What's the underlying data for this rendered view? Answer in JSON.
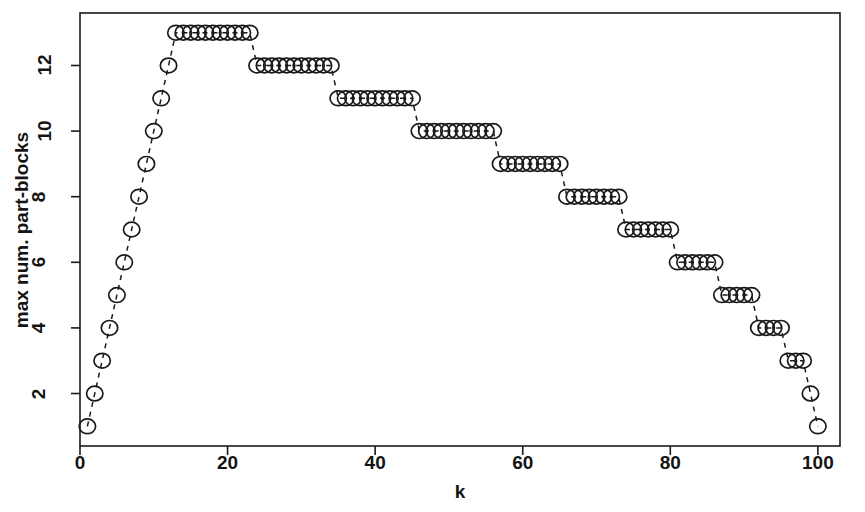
{
  "chart_data": {
    "type": "scatter",
    "title": "",
    "xlabel": "k",
    "ylabel": "max num. part-blocks",
    "xlim": [
      0,
      103
    ],
    "ylim": [
      0.4,
      13.6
    ],
    "xticks": [
      0,
      20,
      40,
      60,
      80,
      100
    ],
    "xtick_labels": [
      "0",
      "20",
      "40",
      "60",
      "80",
      "100"
    ],
    "yticks": [
      2,
      4,
      6,
      8,
      10,
      12
    ],
    "ytick_labels": [
      "2",
      "4",
      "6",
      "8",
      "10",
      "12"
    ],
    "grid": false,
    "legend": null,
    "marker": "open-circle",
    "line_style": "dashed",
    "series_name": "max num. part-blocks",
    "x": [
      1,
      2,
      3,
      4,
      5,
      6,
      7,
      8,
      9,
      10,
      11,
      12,
      13,
      14,
      15,
      16,
      17,
      18,
      19,
      20,
      21,
      22,
      23,
      24,
      25,
      26,
      27,
      28,
      29,
      30,
      31,
      32,
      33,
      34,
      35,
      36,
      37,
      38,
      39,
      40,
      41,
      42,
      43,
      44,
      45,
      46,
      47,
      48,
      49,
      50,
      51,
      52,
      53,
      54,
      55,
      56,
      57,
      58,
      59,
      60,
      61,
      62,
      63,
      64,
      65,
      66,
      67,
      68,
      69,
      70,
      71,
      72,
      73,
      74,
      75,
      76,
      77,
      78,
      79,
      80,
      81,
      82,
      83,
      84,
      85,
      86,
      87,
      88,
      89,
      90,
      91,
      92,
      93,
      94,
      95,
      96,
      97,
      98,
      99,
      100
    ],
    "y": [
      1,
      2,
      3,
      4,
      5,
      6,
      7,
      8,
      9,
      10,
      11,
      12,
      13,
      13,
      13,
      13,
      13,
      13,
      13,
      13,
      13,
      13,
      13,
      12,
      12,
      12,
      12,
      12,
      12,
      12,
      12,
      12,
      12,
      12,
      11,
      11,
      11,
      11,
      11,
      11,
      11,
      11,
      11,
      11,
      11,
      10,
      10,
      10,
      10,
      10,
      10,
      10,
      10,
      10,
      10,
      10,
      9,
      9,
      9,
      9,
      9,
      9,
      9,
      9,
      9,
      8,
      8,
      8,
      8,
      8,
      8,
      8,
      8,
      7,
      7,
      7,
      7,
      7,
      7,
      7,
      6,
      6,
      6,
      6,
      6,
      6,
      5,
      5,
      5,
      5,
      5,
      4,
      4,
      4,
      4,
      3,
      3,
      3,
      2,
      1
    ],
    "plateaus": [
      {
        "value": 13,
        "k_start": 13,
        "k_end": 23
      },
      {
        "value": 12,
        "k_start": 24,
        "k_end": 34
      },
      {
        "value": 11,
        "k_start": 35,
        "k_end": 45
      },
      {
        "value": 10,
        "k_start": 46,
        "k_end": 56
      },
      {
        "value": 9,
        "k_start": 57,
        "k_end": 65
      },
      {
        "value": 8,
        "k_start": 66,
        "k_end": 73
      },
      {
        "value": 7,
        "k_start": 74,
        "k_end": 80
      },
      {
        "value": 6,
        "k_start": 81,
        "k_end": 86
      },
      {
        "value": 5,
        "k_start": 87,
        "k_end": 91
      },
      {
        "value": 4,
        "k_start": 92,
        "k_end": 95
      },
      {
        "value": 3,
        "k_start": 96,
        "k_end": 98
      },
      {
        "value": 2,
        "k_start": 99,
        "k_end": 99
      },
      {
        "value": 1,
        "k_start": 100,
        "k_end": 100
      }
    ],
    "colors": {
      "marker_stroke": "#1a1a1a",
      "marker_fill": "none",
      "line": "#1a1a1a",
      "axis": "#1a1a1a",
      "background": "#ffffff",
      "text": "#141414"
    }
  }
}
